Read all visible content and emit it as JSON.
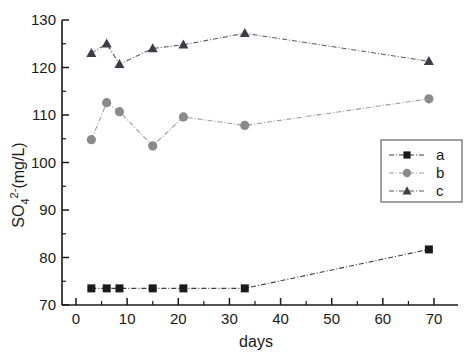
{
  "chart_data": {
    "type": "scatter",
    "title": "",
    "xlabel": "days",
    "ylabel": "SO₄²⁻(mg/L)",
    "ylabel_parts": {
      "base": "SO",
      "subscript": "4",
      "superscript": "2-",
      "units": "(mg/L)"
    },
    "xlim": [
      -5,
      75
    ],
    "ylim": [
      70,
      130
    ],
    "xticks": [
      0,
      10,
      20,
      30,
      40,
      50,
      60,
      70
    ],
    "yticks": [
      70,
      80,
      90,
      100,
      110,
      120,
      130
    ],
    "xtick_labels": [
      "0",
      "10",
      "20",
      "30",
      "40",
      "50",
      "60",
      "70"
    ],
    "ytick_labels": [
      "70",
      "80",
      "90",
      "100",
      "110",
      "120",
      "130"
    ],
    "x_minor_step": 5,
    "y_minor_step": 5,
    "grid": false,
    "legend_position": "center-right",
    "series": [
      {
        "name": "a",
        "marker": "square",
        "color": "#1a1a1a",
        "line_style": "dash-dot",
        "x": [
          3,
          6,
          8.5,
          15,
          21,
          33,
          69
        ],
        "values": [
          73.5,
          73.5,
          73.5,
          73.5,
          73.5,
          73.5,
          81.7
        ]
      },
      {
        "name": "b",
        "marker": "circle",
        "color": "#8a8a8a",
        "line_style": "dash-dot",
        "x": [
          3,
          6,
          8.5,
          15,
          21,
          33,
          69
        ],
        "values": [
          104.8,
          112.6,
          110.7,
          103.5,
          109.6,
          107.8,
          113.4
        ]
      },
      {
        "name": "c",
        "marker": "triangle",
        "color": "#3c3c46",
        "line_style": "dash-dot",
        "x": [
          3,
          6,
          8.5,
          15,
          21,
          33,
          69
        ],
        "values": [
          123.0,
          125.0,
          120.7,
          124.0,
          124.8,
          127.2,
          121.3
        ]
      }
    ]
  },
  "legend": {
    "entries": [
      {
        "label": "a",
        "marker": "square",
        "color": "#1a1a1a"
      },
      {
        "label": "b",
        "marker": "circle",
        "color": "#8a8a8a"
      },
      {
        "label": "c",
        "marker": "triangle",
        "color": "#3c3c46"
      }
    ]
  },
  "axes": {
    "x_title": "days",
    "y_title": "SO₄²⁻(mg/L)"
  }
}
